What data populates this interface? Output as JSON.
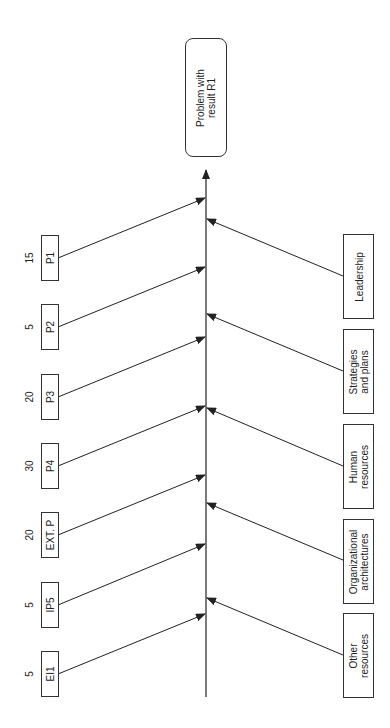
{
  "diagram": {
    "type": "fishbone",
    "orientation": "rotated-90-ccw",
    "effect": {
      "label": "Problem with\nresult R1"
    },
    "left_causes": [
      {
        "label": "P1",
        "value": "15"
      },
      {
        "label": "P2",
        "value": "5"
      },
      {
        "label": "P3",
        "value": "20"
      },
      {
        "label": "P4",
        "value": "30"
      },
      {
        "label": "EXT. P",
        "value": "20"
      },
      {
        "label": "IP5",
        "value": "5"
      },
      {
        "label": "EI1",
        "value": "5"
      }
    ],
    "right_causes": [
      {
        "label": "Leadership"
      },
      {
        "label": "Strategies\nand plans"
      },
      {
        "label": "Human\nresources"
      },
      {
        "label": "Organizational\narchitectures"
      },
      {
        "label": "Other\nresources"
      }
    ],
    "colors": {
      "line": "#222222",
      "background": "#ffffff"
    }
  }
}
